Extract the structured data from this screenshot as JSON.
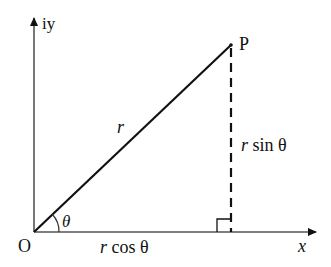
{
  "diagram": {
    "labels": {
      "y_axis": "iy",
      "x_axis": "x",
      "origin": "O",
      "point": "P",
      "radius": "r",
      "angle": "θ",
      "adjacent_r": "r",
      "adjacent_rest": " cos θ",
      "opposite_r": "r",
      "opposite_rest": " sin θ"
    },
    "colors": {
      "axis": "#555555",
      "line": "#111111",
      "background": "#ffffff"
    }
  }
}
